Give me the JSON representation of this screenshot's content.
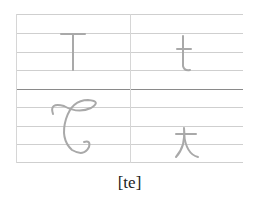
{
  "letters": {
    "print_upper": "T",
    "print_lower": "t",
    "script_upper": "T",
    "script_lower": "t"
  },
  "caption": "[te]",
  "colors": {
    "glyph": "#a9a9a9",
    "ruling": "#cfcfcf",
    "mid_rule": "#8a8a8a"
  }
}
